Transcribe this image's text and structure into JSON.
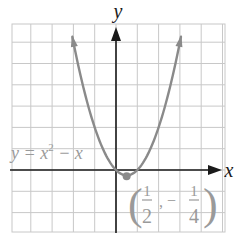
{
  "chart_data": {
    "type": "line",
    "title": "",
    "equation_label": "y = x² − x",
    "equation_parts": {
      "lhs": "y = x",
      "exp": "2",
      "rhs": " − x"
    },
    "xlabel": "x",
    "ylabel": "y",
    "xlim": [
      -5,
      5
    ],
    "ylim": [
      -3,
      7
    ],
    "grid": true,
    "grid_step": 1,
    "series": [
      {
        "name": "y = x^2 - x",
        "x": [
          -2.05,
          -1.5,
          -1,
          -0.5,
          0,
          0.25,
          0.5,
          0.75,
          1,
          1.5,
          2,
          2.5,
          3.05
        ],
        "y": [
          6.25,
          3.75,
          2,
          0.75,
          0,
          -0.1875,
          -0.25,
          -0.1875,
          0,
          0.75,
          2,
          3.75,
          6.25
        ],
        "color": "#8a8a8a",
        "arrows_at_ends": true
      }
    ],
    "annotations": [
      {
        "type": "point",
        "label": "(1/2, −1/4)",
        "x": 0.5,
        "y": -0.25,
        "label_parts": {
          "open": "(",
          "num1": "1",
          "den1": "2",
          "sep": ",",
          "neg": "−",
          "num2": "1",
          "den2": "4",
          "close": ")"
        }
      }
    ]
  },
  "colors": {
    "grid": "#c8c8c8",
    "axes": "#1a1a1a",
    "curve": "#8a8a8a",
    "label": "#9a9a9a"
  }
}
